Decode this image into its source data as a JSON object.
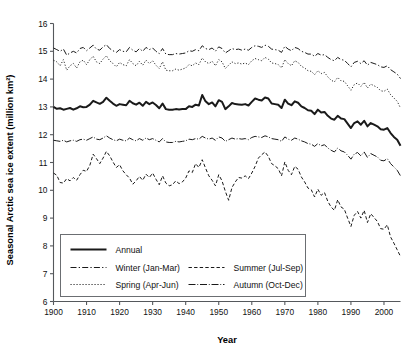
{
  "chart_data": {
    "type": "line",
    "title": "",
    "xlabel": "Year",
    "ylabel": "Seasonal Arctic sea ice extent (million km²)",
    "xlim": [
      1900,
      2005
    ],
    "ylim": [
      6,
      16
    ],
    "xticks": [
      1900,
      1910,
      1920,
      1930,
      1940,
      1950,
      1960,
      1970,
      1980,
      1990,
      2000
    ],
    "yticks": [
      6,
      7,
      8,
      9,
      10,
      11,
      12,
      13,
      14,
      15,
      16
    ],
    "grid": false,
    "legend_position": "lower-left-inside",
    "x": [
      1900,
      1901,
      1902,
      1903,
      1904,
      1905,
      1906,
      1907,
      1908,
      1909,
      1910,
      1911,
      1912,
      1913,
      1914,
      1915,
      1916,
      1917,
      1918,
      1919,
      1920,
      1921,
      1922,
      1923,
      1924,
      1925,
      1926,
      1927,
      1928,
      1929,
      1930,
      1931,
      1932,
      1933,
      1934,
      1935,
      1936,
      1937,
      1938,
      1939,
      1940,
      1941,
      1942,
      1943,
      1944,
      1945,
      1946,
      1947,
      1948,
      1949,
      1950,
      1951,
      1952,
      1953,
      1954,
      1955,
      1956,
      1957,
      1958,
      1959,
      1960,
      1961,
      1962,
      1963,
      1964,
      1965,
      1966,
      1967,
      1968,
      1969,
      1970,
      1971,
      1972,
      1973,
      1974,
      1975,
      1976,
      1977,
      1978,
      1979,
      1980,
      1981,
      1982,
      1983,
      1984,
      1985,
      1986,
      1987,
      1988,
      1989,
      1990,
      1991,
      1992,
      1993,
      1994,
      1995,
      1996,
      1997,
      1998,
      1999,
      2000,
      2001,
      2002,
      2003,
      2004,
      2005
    ],
    "series": [
      {
        "name": "Annual",
        "style": "solid",
        "linewidth": 2.0,
        "values": [
          13.0,
          12.93,
          12.95,
          12.9,
          12.93,
          12.96,
          12.9,
          12.95,
          13.02,
          12.99,
          13.0,
          13.08,
          13.22,
          13.16,
          13.11,
          13.18,
          13.33,
          13.22,
          13.12,
          13.04,
          13.1,
          13.08,
          13.06,
          13.22,
          13.13,
          13.08,
          13.15,
          13.04,
          13.18,
          13.1,
          13.16,
          13.07,
          12.95,
          13.12,
          12.92,
          12.9,
          12.9,
          12.92,
          12.91,
          12.92,
          12.92,
          13.02,
          13.0,
          13.08,
          13.05,
          13.43,
          13.2,
          13.1,
          13.16,
          13.02,
          13.24,
          13.18,
          12.92,
          13.02,
          13.14,
          13.1,
          13.09,
          13.08,
          13.1,
          13.05,
          13.18,
          13.3,
          13.26,
          13.23,
          13.34,
          13.3,
          13.12,
          13.1,
          13.08,
          12.96,
          13.26,
          13.12,
          13.06,
          13.2,
          13.15,
          13.02,
          12.96,
          12.88,
          12.86,
          12.74,
          12.9,
          12.8,
          12.82,
          12.68,
          12.58,
          12.54,
          12.68,
          12.58,
          12.56,
          12.4,
          12.24,
          12.42,
          12.48,
          12.36,
          12.5,
          12.3,
          12.42,
          12.36,
          12.3,
          12.2,
          12.18,
          12.24,
          12.06,
          11.92,
          11.82,
          11.6
        ]
      },
      {
        "name": "Winter (Jan-Mar)",
        "style": "dashdot",
        "linewidth": 1.0,
        "values": [
          15.12,
          15.06,
          15.0,
          15.08,
          14.86,
          14.94,
          15.0,
          14.94,
          15.1,
          15.14,
          15.02,
          15.12,
          15.22,
          15.08,
          15.04,
          15.16,
          15.24,
          15.1,
          15.02,
          14.96,
          15.06,
          15.0,
          14.98,
          15.14,
          15.04,
          14.98,
          15.1,
          15.0,
          15.14,
          15.06,
          15.12,
          15.0,
          14.92,
          15.1,
          14.9,
          14.88,
          14.88,
          14.92,
          14.9,
          14.92,
          14.94,
          15.02,
          15.0,
          15.06,
          15.02,
          15.2,
          15.1,
          15.06,
          15.12,
          15.0,
          15.16,
          15.1,
          14.94,
          15.02,
          15.1,
          15.06,
          15.08,
          15.04,
          15.08,
          15.04,
          15.14,
          15.2,
          15.18,
          15.14,
          15.22,
          15.18,
          15.08,
          15.06,
          15.04,
          14.96,
          15.18,
          15.08,
          15.02,
          15.14,
          15.1,
          15.0,
          14.96,
          14.9,
          14.9,
          14.82,
          14.92,
          14.86,
          14.88,
          14.78,
          14.7,
          14.66,
          14.78,
          14.7,
          14.68,
          14.56,
          14.44,
          14.6,
          14.64,
          14.56,
          14.66,
          14.5,
          14.6,
          14.56,
          14.52,
          14.44,
          14.42,
          14.48,
          14.34,
          14.26,
          14.18,
          14.02
        ]
      },
      {
        "name": "Spring (Apr-Jun)",
        "style": "dotted",
        "linewidth": 1.0,
        "values": [
          14.68,
          14.62,
          14.48,
          14.7,
          14.32,
          14.48,
          14.56,
          14.4,
          14.62,
          14.68,
          14.52,
          14.7,
          14.82,
          14.62,
          14.56,
          14.72,
          14.84,
          14.66,
          14.56,
          14.44,
          14.6,
          14.52,
          14.48,
          14.7,
          14.56,
          14.48,
          14.64,
          14.5,
          14.68,
          14.56,
          14.66,
          14.5,
          14.38,
          14.62,
          14.32,
          14.3,
          14.3,
          14.36,
          14.32,
          14.36,
          14.4,
          14.52,
          14.48,
          14.58,
          14.52,
          14.76,
          14.62,
          14.56,
          14.64,
          14.48,
          14.7,
          14.62,
          14.38,
          14.5,
          14.62,
          14.56,
          14.58,
          14.54,
          14.58,
          14.52,
          14.66,
          14.74,
          14.7,
          14.66,
          14.78,
          14.72,
          14.58,
          14.56,
          14.52,
          14.4,
          14.7,
          14.56,
          14.48,
          14.66,
          14.6,
          14.46,
          14.4,
          14.3,
          14.28,
          14.16,
          14.3,
          14.2,
          14.24,
          14.08,
          13.96,
          13.9,
          14.06,
          13.94,
          13.92,
          13.76,
          13.6,
          13.8,
          13.86,
          13.74,
          13.88,
          13.68,
          13.82,
          13.76,
          13.7,
          13.58,
          13.56,
          13.64,
          13.44,
          13.32,
          13.2,
          12.96
        ]
      },
      {
        "name": "Summer (Jul-Sep)",
        "style": "dashed",
        "linewidth": 1.0,
        "values": [
          10.62,
          10.54,
          10.28,
          10.26,
          10.42,
          10.34,
          10.46,
          10.36,
          10.56,
          10.72,
          10.68,
          10.9,
          11.3,
          11.14,
          10.96,
          11.16,
          11.4,
          11.24,
          11.02,
          10.82,
          10.92,
          10.7,
          10.56,
          10.44,
          10.22,
          10.34,
          10.5,
          10.36,
          10.58,
          10.46,
          10.62,
          10.4,
          10.2,
          10.52,
          10.26,
          10.16,
          10.2,
          10.34,
          10.24,
          10.3,
          10.44,
          10.7,
          10.64,
          10.96,
          10.82,
          11.1,
          10.8,
          10.52,
          10.36,
          10.16,
          10.56,
          10.34,
          9.96,
          9.64,
          10.1,
          10.3,
          10.46,
          10.44,
          10.52,
          10.42,
          10.62,
          10.86,
          11.16,
          11.28,
          11.38,
          11.22,
          10.96,
          10.88,
          10.78,
          10.52,
          11.02,
          10.72,
          10.56,
          10.86,
          10.76,
          10.48,
          10.3,
          10.08,
          10.02,
          9.76,
          10.04,
          9.82,
          9.92,
          9.6,
          9.4,
          9.28,
          9.66,
          9.4,
          9.32,
          9.0,
          8.7,
          9.1,
          9.24,
          9.0,
          9.28,
          8.84,
          9.16,
          9.02,
          8.88,
          8.62,
          8.6,
          8.76,
          8.32,
          8.1,
          7.86,
          7.62
        ]
      },
      {
        "name": "Autumn (Oct-Dec)",
        "style": "longdash",
        "linewidth": 1.0,
        "values": [
          11.8,
          11.78,
          11.76,
          11.8,
          11.74,
          11.78,
          11.8,
          11.76,
          11.82,
          11.84,
          11.8,
          11.86,
          11.92,
          11.84,
          11.82,
          11.88,
          11.96,
          11.88,
          11.82,
          11.78,
          11.84,
          11.8,
          11.78,
          11.88,
          11.82,
          11.78,
          11.86,
          11.8,
          11.88,
          11.82,
          11.86,
          11.8,
          11.74,
          11.86,
          11.74,
          11.72,
          11.72,
          11.76,
          11.74,
          11.76,
          11.78,
          11.84,
          11.82,
          11.86,
          11.84,
          11.94,
          11.88,
          11.84,
          11.88,
          11.8,
          11.92,
          11.88,
          11.76,
          11.82,
          11.88,
          11.84,
          11.86,
          11.84,
          11.86,
          11.82,
          11.9,
          11.94,
          11.92,
          11.9,
          11.96,
          11.92,
          11.86,
          11.84,
          11.82,
          11.76,
          11.92,
          11.84,
          11.8,
          11.88,
          11.84,
          11.78,
          11.74,
          11.68,
          11.66,
          11.58,
          11.68,
          11.6,
          11.64,
          11.52,
          11.44,
          11.38,
          11.52,
          11.42,
          11.38,
          11.26,
          11.12,
          11.3,
          11.36,
          11.24,
          11.38,
          11.18,
          11.32,
          11.26,
          11.2,
          11.08,
          11.06,
          11.14,
          10.96,
          10.84,
          10.72,
          10.52
        ]
      }
    ]
  },
  "legend": {
    "entries": [
      {
        "label": "Annual",
        "style": "solid"
      },
      {
        "label": "Winter (Jan-Mar)",
        "style": "dashdot"
      },
      {
        "label": "Summer (Jul-Sep)",
        "style": "dashed"
      },
      {
        "label": "Spring (Apr-Jun)",
        "style": "dotted"
      },
      {
        "label": "Autumn (Oct-Dec)",
        "style": "longdash"
      }
    ]
  },
  "colors": {
    "line": "#1a1a1a",
    "axis": "#55585c",
    "legend_border": "#6b6e72",
    "background": "#ffffff"
  }
}
